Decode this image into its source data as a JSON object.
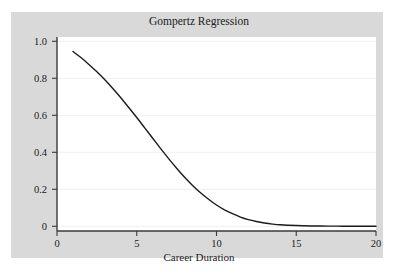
{
  "figure": {
    "background_color": "#ffffff",
    "panel_color": "#d9d9d9",
    "plot_color": "#ffffff"
  },
  "chart_data": {
    "type": "line",
    "title": "Gompertz Regression",
    "xlabel": "Career Duration",
    "ylabel": "",
    "xlim": [
      0,
      20
    ],
    "ylim": [
      0,
      1.04
    ],
    "grid": true,
    "grid_axis": "y",
    "grid_color": "#f2f2f2",
    "legend": null,
    "line_color": "#1a1a1a",
    "line_width": 1.4,
    "xticks": [
      0,
      5,
      10,
      15,
      20
    ],
    "xtick_labels": [
      "0",
      "5",
      "10",
      "15",
      "20"
    ],
    "yticks": [
      0,
      0.2,
      0.4,
      0.6,
      0.8,
      1.0
    ],
    "ytick_labels": [
      "0",
      "0.2",
      "0.4",
      "0.6",
      "0.8",
      "1.0"
    ],
    "series": [
      {
        "name": "Gompertz survival",
        "x": [
          1.0,
          1.5,
          2.0,
          2.5,
          3.0,
          3.5,
          4.0,
          4.5,
          5.0,
          5.5,
          6.0,
          6.5,
          7.0,
          7.5,
          8.0,
          8.5,
          9.0,
          9.5,
          10.0,
          10.5,
          11.0,
          11.5,
          12.0,
          12.5,
          13.0,
          13.5,
          14.0,
          15.0,
          16.0,
          17.0,
          18.0,
          19.0,
          20.0
        ],
        "y": [
          0.945,
          0.912,
          0.875,
          0.835,
          0.792,
          0.745,
          0.695,
          0.642,
          0.588,
          0.532,
          0.476,
          0.42,
          0.366,
          0.314,
          0.265,
          0.221,
          0.181,
          0.146,
          0.115,
          0.089,
          0.068,
          0.05,
          0.036,
          0.026,
          0.018,
          0.012,
          0.008,
          0.004,
          0.002,
          0.001,
          0.0005,
          0.0003,
          0.0002
        ]
      }
    ]
  }
}
